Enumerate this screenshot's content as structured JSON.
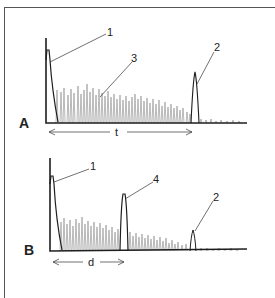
{
  "figure": {
    "panels": [
      {
        "id": "A",
        "label": "A",
        "callouts": [
          {
            "num": "1",
            "description": "initial echo peak"
          },
          {
            "num": "3",
            "description": "echo grass / backscatter"
          },
          {
            "num": "2",
            "description": "back wall echo peak"
          }
        ],
        "interval": {
          "label": "t"
        }
      },
      {
        "id": "B",
        "label": "B",
        "callouts": [
          {
            "num": "1",
            "description": "initial echo peak"
          },
          {
            "num": "4",
            "description": "defect echo peak"
          },
          {
            "num": "2",
            "description": "reduced back wall echo peak"
          }
        ],
        "interval": {
          "label": "d"
        }
      }
    ],
    "colors": {
      "ink": "#222222",
      "grass": "#777777",
      "frame": "#555555",
      "background": "#ffffff"
    }
  }
}
